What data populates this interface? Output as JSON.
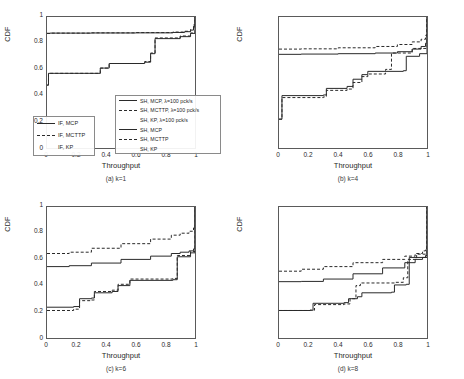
{
  "figure": {
    "axis_labels": {
      "x": "Throughput",
      "y": "CDF"
    },
    "xticks": [
      "0",
      "0.2",
      "0.4",
      "0.6",
      "0.8",
      "1"
    ],
    "yticks": [
      "0",
      "0.2",
      "0.4",
      "0.6",
      "0.8",
      "1"
    ],
    "captions": {
      "a": "(a) k=1",
      "b": "(b) k=4",
      "c": "(c) k=6",
      "d": "(d) k=8"
    }
  },
  "legend_left": {
    "entries": [
      {
        "label": "IF, MCP",
        "style": "solid"
      },
      {
        "label": "IF, MCTTP",
        "style": "dashed"
      },
      {
        "label": "IF, KP",
        "style": "none"
      }
    ]
  },
  "legend_right": {
    "entries": [
      {
        "label": "SH, MCP, λ=100 pck/s",
        "style": "solid"
      },
      {
        "label": "SH, MCTTP, λ=100 pck/s",
        "style": "dashed"
      },
      {
        "label": "SH, KP, λ=100 pck/s",
        "style": "none"
      },
      {
        "label": "SH, MCP",
        "style": "solid"
      },
      {
        "label": "SH, MCTTP",
        "style": "dashed"
      },
      {
        "label": "SH, KP",
        "style": "none"
      }
    ]
  },
  "chart_data": [
    {
      "type": "line",
      "title": "(a) k=1",
      "xlabel": "Throughput",
      "ylabel": "CDF",
      "xlim": [
        0,
        1
      ],
      "ylim": [
        0,
        1
      ],
      "grid": false,
      "series": [
        {
          "name": "SH, MCP, λ=100 pck/s",
          "style": "solid",
          "x": [
            0,
            0.02,
            0.3,
            0.6,
            0.85,
            0.93,
            0.97,
            0.99,
            1.0
          ],
          "y": [
            0.875,
            0.877,
            0.878,
            0.879,
            0.882,
            0.888,
            0.9,
            0.93,
            1.0
          ]
        },
        {
          "name": "SH, MCTTP, λ=100 pck/s",
          "style": "dashed",
          "x": [
            0,
            0.02,
            0.3,
            0.6,
            0.85,
            0.93,
            0.97,
            0.99,
            1.0
          ],
          "y": [
            0.875,
            0.877,
            0.879,
            0.881,
            0.885,
            0.891,
            0.905,
            0.94,
            1.0
          ]
        },
        {
          "name": "SH, MCP",
          "style": "solid",
          "x": [
            0,
            0.01,
            0.36,
            0.42,
            0.66,
            0.7,
            0.73,
            0.9,
            0.97,
            1.0
          ],
          "y": [
            0.48,
            0.57,
            0.61,
            0.645,
            0.655,
            0.72,
            0.835,
            0.85,
            0.875,
            1.0
          ]
        },
        {
          "name": "SH, MCTTP",
          "style": "dashed",
          "x": [
            0,
            0.01,
            0.36,
            0.42,
            0.66,
            0.7,
            0.73,
            0.9,
            0.97,
            1.0
          ],
          "y": [
            0.48,
            0.57,
            0.61,
            0.645,
            0.66,
            0.725,
            0.84,
            0.855,
            0.878,
            1.0
          ]
        }
      ]
    },
    {
      "type": "line",
      "title": "(b) k=4",
      "xlabel": "Throughput",
      "ylabel": "CDF",
      "xlim": [
        0,
        1
      ],
      "ylim": [
        0,
        1
      ],
      "grid": false,
      "series": [
        {
          "name": "SH, MCTTP, λ=100 pck/s",
          "style": "dashed",
          "x": [
            0,
            0.15,
            0.4,
            0.65,
            0.8,
            0.9,
            0.96,
            0.99,
            1.0
          ],
          "y": [
            0.755,
            0.757,
            0.765,
            0.775,
            0.79,
            0.81,
            0.83,
            0.86,
            1.0
          ]
        },
        {
          "name": "SH, MCP, λ=100 pck/s",
          "style": "solid",
          "x": [
            0,
            0.15,
            0.4,
            0.65,
            0.8,
            0.9,
            0.96,
            0.99,
            1.0
          ],
          "y": [
            0.715,
            0.717,
            0.72,
            0.725,
            0.735,
            0.755,
            0.775,
            0.8,
            1.0
          ]
        },
        {
          "name": "SH, MCP",
          "style": "solid",
          "x": [
            0,
            0.02,
            0.3,
            0.32,
            0.46,
            0.5,
            0.56,
            0.6,
            0.84,
            0.86,
            0.95,
            1.0
          ],
          "y": [
            0.22,
            0.4,
            0.405,
            0.455,
            0.47,
            0.525,
            0.56,
            0.585,
            0.59,
            0.7,
            0.72,
            1.0
          ]
        },
        {
          "name": "SH, MCTTP",
          "style": "dashed",
          "x": [
            0,
            0.02,
            0.3,
            0.32,
            0.46,
            0.5,
            0.56,
            0.6,
            0.72,
            0.76,
            0.9,
            1.0
          ],
          "y": [
            0.22,
            0.385,
            0.39,
            0.44,
            0.45,
            0.5,
            0.545,
            0.565,
            0.6,
            0.725,
            0.76,
            1.0
          ]
        }
      ]
    },
    {
      "type": "line",
      "title": "(c) k=6",
      "xlabel": "Throughput",
      "ylabel": "CDF",
      "xlim": [
        0,
        1
      ],
      "ylim": [
        0,
        1
      ],
      "grid": false,
      "series": [
        {
          "name": "SH, MCTTP, λ=100 pck/s",
          "style": "dashed",
          "x": [
            0,
            0.15,
            0.3,
            0.5,
            0.7,
            0.84,
            0.9,
            0.96,
            0.99,
            1.0
          ],
          "y": [
            0.645,
            0.655,
            0.685,
            0.72,
            0.755,
            0.785,
            0.8,
            0.815,
            0.84,
            1.0
          ]
        },
        {
          "name": "SH, MCP, λ=100 pck/s",
          "style": "solid",
          "x": [
            0,
            0.15,
            0.3,
            0.5,
            0.7,
            0.84,
            0.9,
            0.96,
            0.99,
            1.0
          ],
          "y": [
            0.545,
            0.552,
            0.572,
            0.6,
            0.625,
            0.645,
            0.655,
            0.665,
            0.68,
            1.0
          ]
        },
        {
          "name": "SH, MCP",
          "style": "solid",
          "x": [
            0,
            0.18,
            0.22,
            0.3,
            0.32,
            0.44,
            0.48,
            0.56,
            0.85,
            0.88,
            0.97,
            1.0
          ],
          "y": [
            0.235,
            0.24,
            0.3,
            0.305,
            0.345,
            0.355,
            0.4,
            0.44,
            0.445,
            0.62,
            0.65,
            1.0
          ]
        },
        {
          "name": "SH, MCTTP",
          "style": "dashed",
          "x": [
            0,
            0.18,
            0.22,
            0.3,
            0.32,
            0.44,
            0.48,
            0.56,
            0.85,
            0.88,
            0.97,
            1.0
          ],
          "y": [
            0.21,
            0.22,
            0.285,
            0.29,
            0.355,
            0.365,
            0.41,
            0.45,
            0.455,
            0.63,
            0.66,
            1.0
          ]
        }
      ]
    },
    {
      "type": "line",
      "title": "(d) k=8",
      "xlabel": "Throughput",
      "ylabel": "CDF",
      "xlim": [
        0,
        1
      ],
      "ylim": [
        0,
        1
      ],
      "grid": false,
      "series": [
        {
          "name": "SH, MCTTP, λ=100 pck/s",
          "style": "dashed",
          "x": [
            0,
            0.15,
            0.3,
            0.5,
            0.7,
            0.85,
            0.92,
            0.97,
            0.99,
            1.0
          ],
          "y": [
            0.51,
            0.525,
            0.545,
            0.575,
            0.6,
            0.625,
            0.645,
            0.665,
            0.685,
            1.0
          ]
        },
        {
          "name": "SH, MCP, λ=100 pck/s",
          "style": "solid",
          "x": [
            0,
            0.15,
            0.3,
            0.5,
            0.7,
            0.85,
            0.92,
            0.97,
            0.99,
            1.0
          ],
          "y": [
            0.43,
            0.432,
            0.45,
            0.49,
            0.535,
            0.575,
            0.6,
            0.615,
            0.63,
            1.0
          ]
        },
        {
          "name": "SH, MCP",
          "style": "solid",
          "x": [
            0,
            0.21,
            0.23,
            0.44,
            0.47,
            0.53,
            0.56,
            0.76,
            0.78,
            0.86,
            0.88,
            1.0
          ],
          "y": [
            0.21,
            0.212,
            0.265,
            0.27,
            0.3,
            0.315,
            0.345,
            0.35,
            0.405,
            0.41,
            0.615,
            1.0
          ]
        },
        {
          "name": "SH, MCTTP",
          "style": "dashed",
          "x": [
            0,
            0.21,
            0.24,
            0.44,
            0.48,
            0.52,
            0.55,
            0.78,
            0.84,
            0.87,
            0.93,
            1.0
          ],
          "y": [
            0.21,
            0.212,
            0.255,
            0.26,
            0.3,
            0.4,
            0.42,
            0.425,
            0.46,
            0.6,
            0.64,
            1.0
          ]
        }
      ]
    }
  ]
}
